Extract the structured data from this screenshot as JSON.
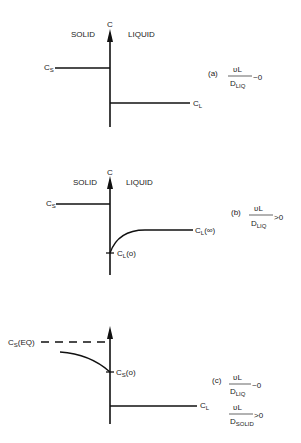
{
  "panels": [
    {
      "id": "a",
      "axis_label": "C",
      "left_region": "SOLID",
      "right_region": "LIQUID",
      "solid_label": "C",
      "solid_sub": "S",
      "liquid_label": "C",
      "liquid_sub": "L",
      "case": "(a)",
      "formula": [
        {
          "num": "ʋL",
          "den": "D",
          "den_sub": "LIQ",
          "rel": "~0"
        }
      ]
    },
    {
      "id": "b",
      "axis_label": "C",
      "left_region": "SOLID",
      "right_region": "LIQUID",
      "solid_label": "C",
      "solid_sub": "S",
      "liquid_label": "C",
      "liquid_sub": "L",
      "liquid_suffix": "(∞)",
      "interface_label": "C",
      "interface_sub": "L",
      "interface_suffix": "(o)",
      "case": "(b)",
      "formula": [
        {
          "num": "ʋL",
          "den": "D",
          "den_sub": "LIQ",
          "rel": ">0"
        }
      ]
    },
    {
      "id": "c",
      "solid_eq_label": "C",
      "solid_eq_sub": "S",
      "solid_eq_suffix": "(EQ)",
      "interface_label": "C",
      "interface_sub": "S",
      "interface_suffix": "(o)",
      "liquid_label": "C",
      "liquid_sub": "L",
      "case": "(c)",
      "formula": [
        {
          "num": "ʋL",
          "den": "D",
          "den_sub": "LIQ",
          "rel": "~0"
        },
        {
          "num": "ʋL",
          "den": "D",
          "den_sub": "SOLID",
          "rel": ">0"
        }
      ]
    }
  ]
}
